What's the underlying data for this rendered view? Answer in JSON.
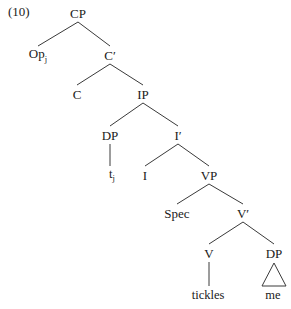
{
  "figure": {
    "example_number": "(10)",
    "kind": "syntax-tree",
    "line_color": "#3a3a3a",
    "text_color": "#1a1a1a",
    "background": "#ffffff"
  },
  "tree": {
    "nodes": [
      {
        "id": "CP",
        "label": "CP",
        "x": 78,
        "y": 13,
        "type": "category"
      },
      {
        "id": "Op",
        "label": "Op",
        "sub": "j",
        "x": 38,
        "y": 55,
        "type": "category"
      },
      {
        "id": "Cbar",
        "label": "C",
        "prime": "′",
        "x": 110,
        "y": 55,
        "type": "category"
      },
      {
        "id": "C",
        "label": "C",
        "x": 77,
        "y": 94,
        "type": "category"
      },
      {
        "id": "IP",
        "label": "IP",
        "x": 143,
        "y": 94,
        "type": "category"
      },
      {
        "id": "DP1",
        "label": "DP",
        "x": 110,
        "y": 135,
        "type": "category"
      },
      {
        "id": "Ibar",
        "label": "I",
        "prime": "′",
        "x": 178,
        "y": 135,
        "type": "category"
      },
      {
        "id": "trace",
        "label": "t",
        "sub": "j",
        "x": 112,
        "y": 175,
        "type": "leaf"
      },
      {
        "id": "I",
        "label": "I",
        "x": 145,
        "y": 175,
        "type": "category"
      },
      {
        "id": "VP",
        "label": "VP",
        "x": 209,
        "y": 175,
        "type": "category"
      },
      {
        "id": "Spec",
        "label": "Spec",
        "x": 177,
        "y": 213,
        "type": "category"
      },
      {
        "id": "Vbar",
        "label": "V",
        "prime": "′",
        "x": 243,
        "y": 213,
        "type": "category"
      },
      {
        "id": "V",
        "label": "V",
        "x": 209,
        "y": 253,
        "type": "category"
      },
      {
        "id": "DP2",
        "label": "DP",
        "x": 274,
        "y": 253,
        "type": "category"
      },
      {
        "id": "tickles",
        "label": "tickles",
        "x": 208,
        "y": 295,
        "type": "leaf"
      },
      {
        "id": "me",
        "label": "me",
        "x": 273,
        "y": 295,
        "type": "leaf"
      }
    ],
    "edges": [
      {
        "from": "CP",
        "to": "Op",
        "style": "branch"
      },
      {
        "from": "CP",
        "to": "Cbar",
        "style": "branch"
      },
      {
        "from": "Cbar",
        "to": "C",
        "style": "branch"
      },
      {
        "from": "Cbar",
        "to": "IP",
        "style": "branch"
      },
      {
        "from": "IP",
        "to": "DP1",
        "style": "branch"
      },
      {
        "from": "IP",
        "to": "Ibar",
        "style": "branch"
      },
      {
        "from": "DP1",
        "to": "trace",
        "style": "stem"
      },
      {
        "from": "Ibar",
        "to": "I",
        "style": "branch"
      },
      {
        "from": "Ibar",
        "to": "VP",
        "style": "branch"
      },
      {
        "from": "VP",
        "to": "Spec",
        "style": "branch"
      },
      {
        "from": "VP",
        "to": "Vbar",
        "style": "branch"
      },
      {
        "from": "Vbar",
        "to": "V",
        "style": "branch"
      },
      {
        "from": "Vbar",
        "to": "DP2",
        "style": "branch"
      },
      {
        "from": "V",
        "to": "tickles",
        "style": "stem"
      }
    ],
    "triangles": [
      {
        "over": "me",
        "parent": "DP2",
        "apex_y": 263,
        "base_y": 286,
        "half_width": 12
      }
    ]
  }
}
